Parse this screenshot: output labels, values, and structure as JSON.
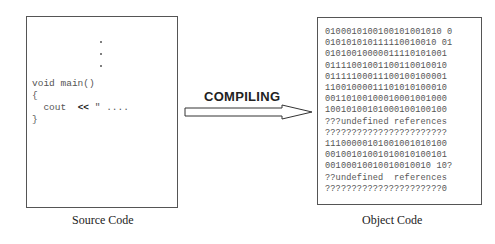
{
  "source": {
    "caption": "Source Code",
    "dots": [
      ".",
      ".",
      "."
    ],
    "lines": [
      "void main()",
      "{",
      "  cout",
      "}"
    ],
    "cout_op": "<<",
    "cout_rest": " \" ...."
  },
  "process": {
    "label": "COMPILING",
    "arrow_direction": "right"
  },
  "object": {
    "caption": "Object Code",
    "lines": [
      "0100010100100101001010 0",
      "010101010111110010010 01",
      "01010010000011110101001",
      "01111001001100110010010",
      "01111100011100100100001",
      "11001000011101010100010",
      "00110100100010001001000",
      "10010100101000100100100",
      "???undefined references",
      "???????????????????????",
      "11100000101001001010100",
      "00100101001010010100101",
      "00100010010010010010 10?",
      "??undefined  references",
      "??????????????????????0"
    ]
  }
}
